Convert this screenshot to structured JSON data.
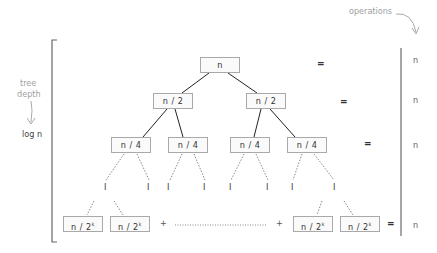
{
  "labels": {
    "operations": "operations",
    "tree_depth_1": "tree",
    "tree_depth_2": "depth",
    "log_n": "log n"
  },
  "tree": {
    "level0": [
      "n"
    ],
    "level1": [
      "n / 2",
      "n / 2"
    ],
    "level2": [
      "n / 4",
      "n / 4",
      "n / 4",
      "n / 4"
    ],
    "leaf_marker": "I",
    "bottom": {
      "base": "n / 2",
      "exp": "k"
    }
  },
  "equals": "=",
  "plus": "+",
  "operations_column": [
    "n",
    "n",
    "n",
    "n"
  ],
  "colors": {
    "box_border": "#a9a9a9",
    "edge": "#222222",
    "annotation": "#a0a0a0",
    "dotted": "#888888"
  }
}
